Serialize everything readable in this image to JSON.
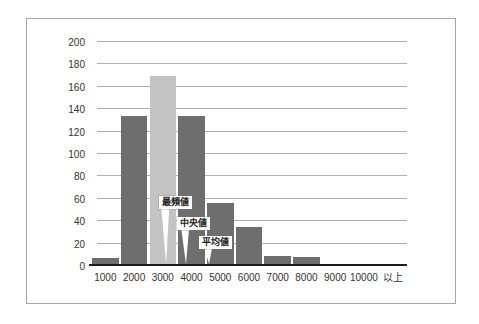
{
  "chart_data": {
    "type": "bar",
    "title": "",
    "xlabel": "",
    "ylabel": "",
    "categories": [
      "1000",
      "2000",
      "3000",
      "4000",
      "5000",
      "6000",
      "7000",
      "8000",
      "9000",
      "10000",
      "以上"
    ],
    "values": [
      7,
      134,
      170,
      134,
      56,
      35,
      9,
      8,
      1,
      2,
      1
    ],
    "highlight_index": 2,
    "ylim": [
      0,
      200
    ],
    "ytick_step": 20,
    "yticks": [
      0,
      20,
      40,
      60,
      80,
      100,
      120,
      140,
      160,
      180,
      200
    ],
    "grid": "horizontal",
    "legend": "none",
    "annotations": [
      {
        "label": "最頻値",
        "meaning": "mode",
        "box_left_pct": 21.6,
        "box_top_pct": 68.8,
        "tip_left_pct": 23.5
      },
      {
        "label": "中央値",
        "meaning": "median",
        "box_left_pct": 27.3,
        "box_top_pct": 78.1,
        "tip_left_pct": 29.8
      },
      {
        "label": "平均値",
        "meaning": "mean",
        "box_left_pct": 34.3,
        "box_top_pct": 86.6,
        "tip_left_pct": 37.1
      }
    ],
    "colors": {
      "bar": "#6e6e6e",
      "highlight_bar": "#c3c3c3",
      "gridline": "#b0b0b0",
      "axis": "#1c1c1c",
      "tick_text": "#333333",
      "panel_border": "#a6a6a6",
      "background": "#ffffff",
      "callout_bg": "#ffffff",
      "callout_text": "#222222"
    }
  }
}
